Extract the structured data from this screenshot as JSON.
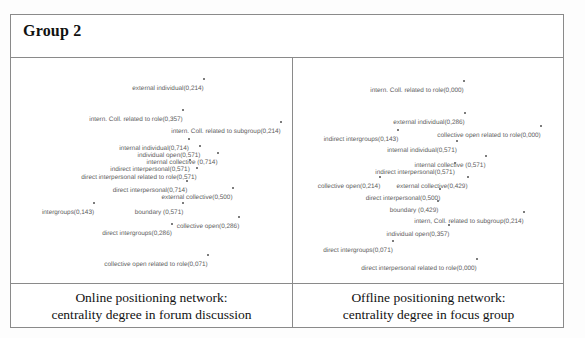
{
  "header": {
    "title": "Group 2"
  },
  "panels": [
    {
      "id": "online",
      "caption_line1": "Online positioning network:",
      "caption_line2": "centrality degree in forum discussion",
      "nodes": [
        {
          "label": "external individual(0,214)",
          "x": 157,
          "y": 27
        },
        {
          "label": "intern. Coll. related to role(0,357)",
          "x": 125,
          "y": 58
        },
        {
          "label": "intern. Coll. related to subgroup(0,214)",
          "x": 215,
          "y": 70
        },
        {
          "label": "internal individual(0,714)",
          "x": 143,
          "y": 87
        },
        {
          "label": "individual open(0,571)",
          "x": 158,
          "y": 94
        },
        {
          "label": "internal collective (0,714)",
          "x": 171,
          "y": 101
        },
        {
          "label": "indirect interpersonal(0,571)",
          "x": 139,
          "y": 108
        },
        {
          "label": "direct interpersonal related to role(0,571)",
          "x": 128,
          "y": 116
        },
        {
          "label": "direct interpersonal(0,714)",
          "x": 139,
          "y": 129
        },
        {
          "label": "external collective(0,500)",
          "x": 186,
          "y": 136
        },
        {
          "label": "intergroups(0,143)",
          "x": 57,
          "y": 151
        },
        {
          "label": "boundary (0,571)",
          "x": 148,
          "y": 151
        },
        {
          "label": "collective open(0,286)",
          "x": 197,
          "y": 165
        },
        {
          "label": "direct intergroups(0,286)",
          "x": 126,
          "y": 172
        },
        {
          "label": "collective open related to role(0,071)",
          "x": 145,
          "y": 203
        }
      ]
    },
    {
      "id": "offline",
      "caption_line1": "Offline positioning network:",
      "caption_line2": "centrality degree in focus group",
      "nodes": [
        {
          "label": "intern. Coll. related to role(0,000)",
          "x": 124,
          "y": 29
        },
        {
          "label": "external individual(0,286)",
          "x": 136,
          "y": 61
        },
        {
          "label": "indirect intergroups(0,143)",
          "x": 68,
          "y": 78
        },
        {
          "label": "collective open related to role(0,000)",
          "x": 196,
          "y": 74
        },
        {
          "label": "internal individual(0,571)",
          "x": 129,
          "y": 89
        },
        {
          "label": "internal collective (0,571)",
          "x": 157,
          "y": 104
        },
        {
          "label": "indirect interpersonal(0,571)",
          "x": 122,
          "y": 111
        },
        {
          "label": "collective open(0,214)",
          "x": 56,
          "y": 125
        },
        {
          "label": "external collective(0,429)",
          "x": 139,
          "y": 125
        },
        {
          "label": "direct interpersonal(0,500)",
          "x": 110,
          "y": 137
        },
        {
          "label": "boundary (0,429)",
          "x": 121,
          "y": 149
        },
        {
          "label": "intern, Coll. related to subgroup(0,214)",
          "x": 176,
          "y": 160
        },
        {
          "label": "individual open(0,357)",
          "x": 125,
          "y": 173
        },
        {
          "label": "direct intergroups(0,071)",
          "x": 65,
          "y": 189
        },
        {
          "label": "direct interpersonal related to role(0,000)",
          "x": 126,
          "y": 207
        }
      ]
    }
  ]
}
